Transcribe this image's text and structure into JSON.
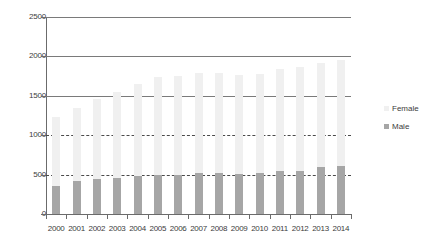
{
  "chart_data": {
    "type": "bar",
    "stacked": true,
    "title": "",
    "subtitle": "",
    "xlabel": "",
    "ylabel": "",
    "categories": [
      "2000",
      "2001",
      "2002",
      "2003",
      "2004",
      "2005",
      "2006",
      "2007",
      "2008",
      "2009",
      "2010",
      "2011",
      "2012",
      "2013",
      "2014"
    ],
    "series": [
      {
        "name": "Male",
        "color": "#a6a6a6",
        "values": [
          355,
          415,
          450,
          460,
          480,
          495,
          500,
          515,
          525,
          505,
          515,
          545,
          545,
          600,
          610
        ]
      },
      {
        "name": "Female",
        "color": "#f0f0f0",
        "values": [
          875,
          935,
          1015,
          1090,
          1165,
          1245,
          1255,
          1275,
          1270,
          1255,
          1265,
          1295,
          1320,
          1320,
          1340
        ]
      }
    ],
    "totals": [
      1230,
      1350,
      1465,
      1550,
      1645,
      1740,
      1755,
      1790,
      1795,
      1760,
      1780,
      1840,
      1865,
      1920,
      1950
    ],
    "ylim": [
      0,
      2500
    ],
    "yticks": [
      0,
      500,
      1000,
      1500,
      2000,
      2500
    ],
    "ytick_labels": [
      "0",
      "500",
      "1000",
      "1500",
      "2000",
      "2500"
    ],
    "gridlines": [
      {
        "value": 2500,
        "style": "solid"
      },
      {
        "value": 2000,
        "style": "solid"
      },
      {
        "value": 1500,
        "style": "solid"
      },
      {
        "value": 1000,
        "style": "dashed"
      },
      {
        "value": 500,
        "style": "dashed"
      }
    ],
    "legend": {
      "position": "right",
      "entries": [
        {
          "label": "Female",
          "color": "#f0f0f0"
        },
        {
          "label": "Male",
          "color": "#a6a6a6"
        }
      ]
    },
    "axis_color": "#6b6b6b",
    "background": "#ffffff"
  }
}
